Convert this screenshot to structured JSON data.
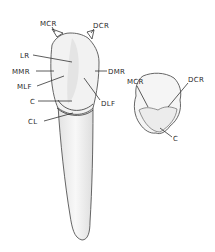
{
  "figure": {
    "lingual_view": {
      "labels": [
        {
          "key": "mcr",
          "text": "MCR"
        },
        {
          "key": "dcr",
          "text": "DCR"
        },
        {
          "key": "lr",
          "text": "LR"
        },
        {
          "key": "mmr",
          "text": "MMR"
        },
        {
          "key": "dmr",
          "text": "DMR"
        },
        {
          "key": "mlf",
          "text": "MLF"
        },
        {
          "key": "dlf",
          "text": "DLF"
        },
        {
          "key": "c",
          "text": "C"
        },
        {
          "key": "cl",
          "text": "CL"
        }
      ]
    },
    "incisal_view": {
      "labels": [
        {
          "key": "mcr",
          "text": "MCR"
        },
        {
          "key": "dcr",
          "text": "DCR"
        },
        {
          "key": "c",
          "text": "C"
        }
      ]
    },
    "colors": {
      "line": "#333333",
      "fill": "#f4f4f4",
      "shade": "#dcdcdc"
    }
  }
}
